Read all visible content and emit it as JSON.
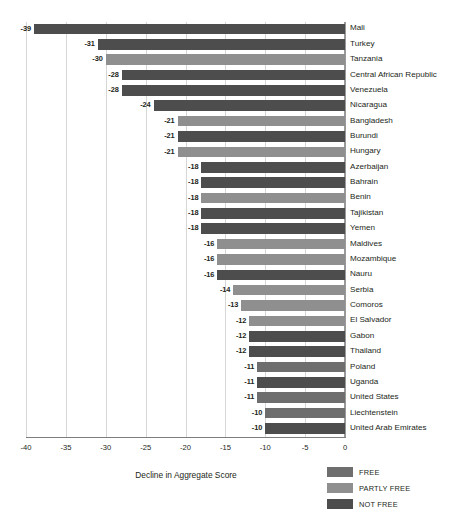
{
  "chart_data": {
    "type": "bar",
    "orientation": "horizontal",
    "title": "",
    "xlabel": "Decline in Aggregate Score",
    "ylabel": "",
    "xlim": [
      -40,
      0
    ],
    "xticks": [
      -40,
      -35,
      -30,
      -25,
      -20,
      -15,
      -10,
      -5,
      0
    ],
    "xtick_labels": [
      "-40",
      "-35",
      "-30",
      "-25",
      "-20",
      "-15",
      "-10",
      "-5",
      "0"
    ],
    "grid": true,
    "legend_position": "bottom-right",
    "categories": [
      "Mali",
      "Turkey",
      "Tanzania",
      "Central African Republic",
      "Venezuela",
      "Nicaragua",
      "Bangladesh",
      "Burundi",
      "Hungary",
      "Azerbaijan",
      "Bahrain",
      "Benin",
      "Tajikistan",
      "Yemen",
      "Maldives",
      "Mozambique",
      "Nauru",
      "Serbia",
      "Comoros",
      "El Salvador",
      "Gabon",
      "Thailand",
      "Poland",
      "Uganda",
      "United States",
      "Liechtenstein",
      "United Arab Emirates"
    ],
    "values": [
      -39,
      -31,
      -30,
      -28,
      -28,
      -24,
      -21,
      -21,
      -21,
      -18,
      -18,
      -18,
      -18,
      -18,
      -16,
      -16,
      -16,
      -14,
      -13,
      -12,
      -12,
      -12,
      -11,
      -11,
      -11,
      -10,
      -10
    ],
    "value_labels": [
      "-39",
      "-31",
      "-30",
      "-28",
      "-28",
      "-24",
      "-21",
      "-21",
      "-21",
      "-18",
      "-18",
      "-18",
      "-18",
      "-18",
      "-16",
      "-16",
      "-16",
      "-14",
      "-13",
      "-12",
      "-12",
      "-12",
      "-11",
      "-11",
      "-11",
      "-10",
      "-10"
    ],
    "status": [
      "NOT FREE",
      "NOT FREE",
      "PARTLY FREE",
      "NOT FREE",
      "NOT FREE",
      "NOT FREE",
      "PARTLY FREE",
      "NOT FREE",
      "PARTLY FREE",
      "NOT FREE",
      "NOT FREE",
      "PARTLY FREE",
      "NOT FREE",
      "NOT FREE",
      "PARTLY FREE",
      "PARTLY FREE",
      "NOT FREE",
      "PARTLY FREE",
      "PARTLY FREE",
      "PARTLY FREE",
      "NOT FREE",
      "NOT FREE",
      "FREE",
      "NOT FREE",
      "FREE",
      "FREE",
      "NOT FREE"
    ],
    "legend": [
      {
        "label": "FREE",
        "color": "#6e6e6e"
      },
      {
        "label": "PARTLY FREE",
        "color": "#8f8f8f"
      },
      {
        "label": "NOT FREE",
        "color": "#4d4d4d"
      }
    ]
  },
  "colors": {
    "free": "#6e6e6e",
    "partly_free": "#8f8f8f",
    "not_free": "#4d4d4d",
    "gridline": "#d6d6d6",
    "axis": "#9a9a9a",
    "text": "#231f20",
    "background": "#ffffff"
  }
}
